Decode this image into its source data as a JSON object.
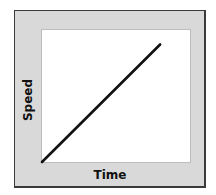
{
  "chart_data": {
    "type": "line",
    "title": "",
    "xlabel": "Time",
    "ylabel": "Speed",
    "x": [
      0,
      1
    ],
    "series": [
      {
        "name": "Speed",
        "values": [
          0,
          1
        ]
      }
    ],
    "xlim": [
      0,
      1.27
    ],
    "ylim": [
      0,
      1.14
    ],
    "grid": false,
    "ticks": false,
    "legend": "none",
    "colors": {
      "line": "#111111",
      "frame": "#d9d9d9",
      "plot_bg": "#ffffff"
    }
  },
  "labels": {
    "x": "Time",
    "y": "Speed"
  }
}
